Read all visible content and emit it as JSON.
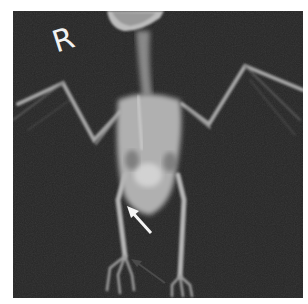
{
  "image": {
    "type": "radiograph",
    "subject": "bird skeleton, ventrodorsal view",
    "background_color": "#262626",
    "marker_label": "R",
    "annotations": [
      {
        "name": "white-arrow",
        "color": "#f5f5f5",
        "from": [
          151,
          233
        ],
        "to": [
          128,
          208
        ]
      },
      {
        "name": "dark-arrow",
        "color": "#4a4a4a",
        "from": [
          165,
          283
        ],
        "to": [
          131,
          259
        ]
      }
    ]
  }
}
